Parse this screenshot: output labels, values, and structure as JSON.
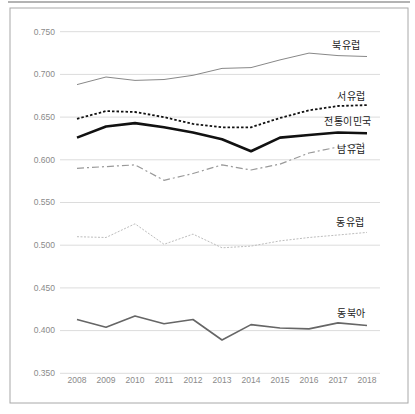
{
  "figure": {
    "background": "#ffffff",
    "frame_border_color": "#a8a8a8",
    "top_rule_color": "#9a9a9a",
    "gridline_color": "#dcdcdc",
    "tick_label_color": "#8a8a8a",
    "series_label_color": "#222222"
  },
  "chart_data": {
    "type": "line",
    "title": "",
    "xlabel": "",
    "ylabel": "",
    "grid": "horizontal",
    "ylim": [
      0.35,
      0.75
    ],
    "ytick_step": 0.05,
    "ytick_labels": [
      "0.350",
      "0.400",
      "0.450",
      "0.500",
      "0.550",
      "0.600",
      "0.650",
      "0.700",
      "0.750"
    ],
    "x": [
      2008,
      2009,
      2010,
      2011,
      2012,
      2013,
      2014,
      2015,
      2016,
      2017,
      2018
    ],
    "xtick_labels": [
      "2008",
      "2009",
      "2010",
      "2011",
      "2012",
      "2013",
      "2014",
      "2015",
      "2016",
      "2017",
      "2018"
    ],
    "legend_position": "inline-right-of-lines",
    "series": [
      {
        "name": "북유럽",
        "color": "#888888",
        "width": 1,
        "dash": "",
        "values": [
          0.688,
          0.697,
          0.693,
          0.694,
          0.699,
          0.707,
          0.708,
          0.717,
          0.725,
          0.722,
          0.721
        ]
      },
      {
        "name": "서유럽",
        "color": "#111111",
        "width": 1.8,
        "dash": "2.5 2",
        "values": [
          0.648,
          0.657,
          0.656,
          0.65,
          0.642,
          0.638,
          0.638,
          0.649,
          0.658,
          0.663,
          0.664
        ]
      },
      {
        "name": "전통이민국",
        "color": "#111111",
        "width": 2.6,
        "dash": "",
        "values": [
          0.626,
          0.639,
          0.643,
          0.638,
          0.632,
          0.624,
          0.61,
          0.626,
          0.629,
          0.632,
          0.631
        ]
      },
      {
        "name": "남유럽",
        "color": "#999999",
        "width": 1.2,
        "dash": "7 3 2 3",
        "values": [
          0.59,
          0.592,
          0.594,
          0.576,
          0.584,
          0.594,
          0.588,
          0.595,
          0.608,
          0.615,
          0.62
        ]
      },
      {
        "name": "동유럽",
        "color": "#bdbdbd",
        "width": 1,
        "dash": "2 1.5",
        "values": [
          0.51,
          0.509,
          0.525,
          0.501,
          0.513,
          0.497,
          0.499,
          0.505,
          0.509,
          0.512,
          0.515
        ]
      },
      {
        "name": "동북아",
        "color": "#666666",
        "width": 1.6,
        "dash": "",
        "values": [
          0.413,
          0.404,
          0.417,
          0.408,
          0.413,
          0.389,
          0.407,
          0.403,
          0.402,
          0.409,
          0.406
        ]
      }
    ]
  },
  "series_label_positions": [
    {
      "left": 332,
      "top": 41
    },
    {
      "left": 337,
      "top": 92
    },
    {
      "left": 324,
      "top": 117
    },
    {
      "left": 337,
      "top": 145
    },
    {
      "left": 336,
      "top": 218
    },
    {
      "left": 337,
      "top": 309
    }
  ]
}
